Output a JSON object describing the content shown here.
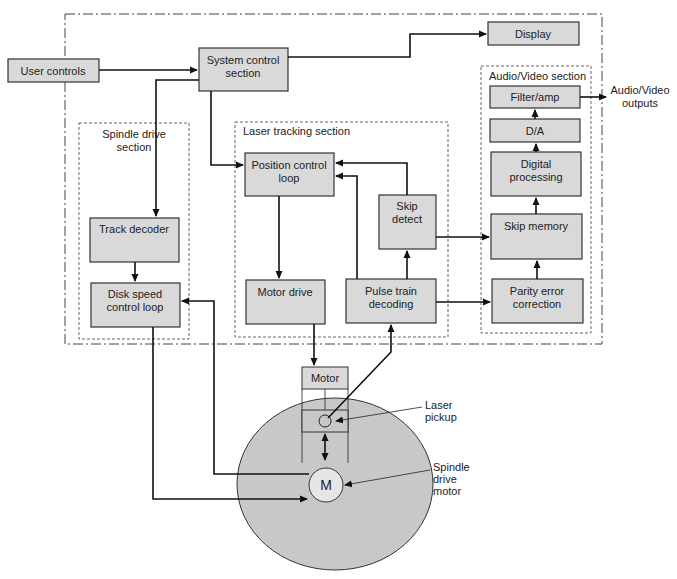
{
  "diagram": {
    "outer_boundary": "system",
    "sections": {
      "spindle": {
        "label_line1": "Spindle drive",
        "label_line2": "section"
      },
      "laser": {
        "label": "Laser tracking section"
      },
      "av": {
        "label": "Audio/Video section"
      }
    },
    "blocks": {
      "user_controls": "User controls",
      "system_control_1": "System control",
      "system_control_2": "section",
      "display": "Display",
      "filter_amp": "Filter/amp",
      "da": "D/A",
      "digital_processing_1": "Digital",
      "digital_processing_2": "processing",
      "skip_memory": "Skip memory",
      "parity_1": "Parity error",
      "parity_2": "correction",
      "track_decoder": "Track decoder",
      "disk_speed_1": "Disk speed",
      "disk_speed_2": "control loop",
      "position_control_1": "Position control",
      "position_control_2": "loop",
      "motor_drive": "Motor drive",
      "pulse_train_1": "Pulse train",
      "pulse_train_2": "decoding",
      "skip_detect_1": "Skip",
      "skip_detect_2": "detect",
      "motor": "Motor",
      "spindle_motor": "M"
    },
    "annotations": {
      "av_outputs_1": "Audio/Video",
      "av_outputs_2": "outputs",
      "laser_pickup_1": "Laser",
      "laser_pickup_2": "pickup",
      "spindle_motor_1": "Spindle",
      "spindle_motor_2": "drive",
      "spindle_motor_3": "motor"
    },
    "colors": {
      "block_fill": "#d9d9d9",
      "disk_fill": "#c8c8c8",
      "line": "#111111"
    }
  }
}
